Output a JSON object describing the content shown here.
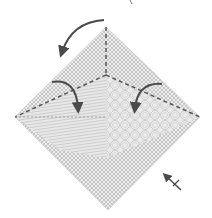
{
  "diagram": {
    "type": "origami-folding-step",
    "colors": {
      "background": "#ffffff",
      "paper_pattern": "#a8a8a8",
      "paper_light": "#e4e4e4",
      "paper_mid": "#d0d0d0",
      "fold_line": "#555555",
      "arrow": "#4a4a4a"
    },
    "shapes": {
      "outer_diamond": {
        "top": [
          106,
          27
        ],
        "left": [
          15,
          117
        ],
        "right": [
          200,
          117
        ],
        "bottom": [
          108,
          210
        ]
      },
      "center": [
        106,
        75
      ],
      "inner_left_flap": {
        "points": [
          [
            15,
            117
          ],
          [
            106,
            75
          ],
          [
            106,
            158
          ]
        ]
      },
      "inner_right_flap": {
        "points": [
          [
            106,
            75
          ],
          [
            200,
            117
          ],
          [
            106,
            158
          ]
        ]
      }
    },
    "fold_lines": [
      {
        "name": "valley-fold-vertical",
        "from": [
          106,
          27
        ],
        "to": [
          106,
          75
        ]
      },
      {
        "name": "valley-fold-left",
        "from": [
          106,
          75
        ],
        "to": [
          15,
          117
        ]
      },
      {
        "name": "valley-fold-right",
        "from": [
          106,
          75
        ],
        "to": [
          200,
          117
        ]
      },
      {
        "name": "crease-horizontal",
        "from": [
          15,
          117
        ],
        "to": [
          106,
          117
        ]
      }
    ],
    "arrows": [
      {
        "name": "fold-top-arrow",
        "description": "curved arrow from top to upper-left"
      },
      {
        "name": "fold-left-flap-arrow",
        "description": "curved arrow folding left flap downward"
      },
      {
        "name": "fold-right-flap-arrow",
        "description": "curved arrow folding right flap downward"
      },
      {
        "name": "turn-over-arrow",
        "description": "small arrow pointing up-left near bottom-right edge"
      }
    ]
  }
}
